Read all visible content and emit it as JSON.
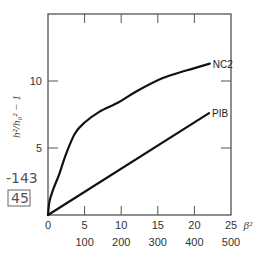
{
  "chart_data": {
    "type": "line",
    "title": "",
    "xlabel": "β²",
    "ylabel": "h²/h₀² − 1",
    "xlim": [
      0,
      25
    ],
    "ylim": [
      0,
      15
    ],
    "x_ticks": [
      0,
      5,
      10,
      15,
      20,
      25
    ],
    "x_tick_labels": [
      "0",
      "5",
      "10",
      "15",
      "20",
      "25"
    ],
    "x_secondary_tick_labels": [
      "100",
      "200",
      "300",
      "400",
      "500"
    ],
    "y_ticks": [
      5,
      10
    ],
    "y_tick_labels": [
      "5",
      "10"
    ],
    "grid": false,
    "series": [
      {
        "name": "NC2",
        "x": [
          0,
          0.2,
          0.7,
          1.5,
          2.5,
          3.7,
          5,
          7,
          9.6,
          12,
          15.6,
          19,
          22.1
        ],
        "values": [
          0,
          1.0,
          1.9,
          3.0,
          4.6,
          6.1,
          6.9,
          7.7,
          8.4,
          9.2,
          10.2,
          10.8,
          11.3
        ]
      },
      {
        "name": "PIB",
        "x": [
          0,
          22
        ],
        "values": [
          0,
          7.6
        ]
      }
    ],
    "annotations": [
      "-143",
      "45"
    ]
  }
}
